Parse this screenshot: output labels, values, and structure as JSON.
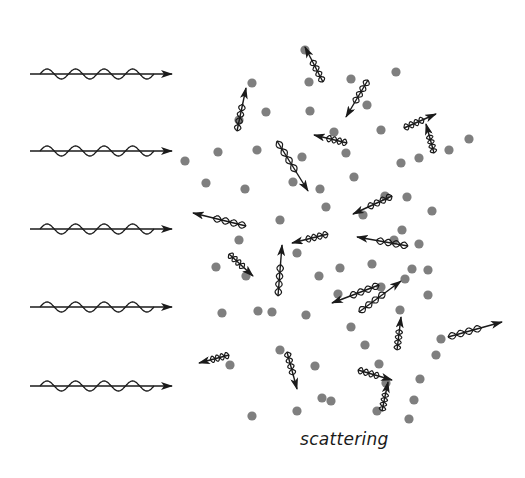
{
  "diagram": {
    "caption": "scattering",
    "colors": {
      "particle": "#7f7f7f",
      "wave": "#1a1a1a",
      "background": "#ffffff"
    },
    "incoming_waves": {
      "x_start": 30,
      "x_end": 172,
      "amplitude": 5,
      "cycles": 4,
      "rows_y": [
        74,
        151,
        229,
        307,
        386
      ]
    },
    "particles": [
      [
        305,
        50
      ],
      [
        252,
        83
      ],
      [
        309,
        82
      ],
      [
        351,
        79
      ],
      [
        396,
        72
      ],
      [
        367,
        105
      ],
      [
        266,
        112
      ],
      [
        310,
        111
      ],
      [
        239,
        120
      ],
      [
        334,
        132
      ],
      [
        381,
        130
      ],
      [
        185,
        161
      ],
      [
        218,
        152
      ],
      [
        257,
        150
      ],
      [
        302,
        157
      ],
      [
        346,
        153
      ],
      [
        401,
        163
      ],
      [
        419,
        158
      ],
      [
        449,
        150
      ],
      [
        469,
        139
      ],
      [
        206,
        183
      ],
      [
        245,
        189
      ],
      [
        293,
        182
      ],
      [
        320,
        189
      ],
      [
        354,
        177
      ],
      [
        385,
        196
      ],
      [
        407,
        197
      ],
      [
        432,
        211
      ],
      [
        239,
        240
      ],
      [
        280,
        220
      ],
      [
        326,
        207
      ],
      [
        363,
        215
      ],
      [
        394,
        240
      ],
      [
        402,
        230
      ],
      [
        419,
        244
      ],
      [
        216,
        267
      ],
      [
        246,
        276
      ],
      [
        297,
        253
      ],
      [
        319,
        276
      ],
      [
        340,
        268
      ],
      [
        372,
        264
      ],
      [
        412,
        269
      ],
      [
        428,
        270
      ],
      [
        222,
        313
      ],
      [
        258,
        311
      ],
      [
        306,
        315
      ],
      [
        338,
        294
      ],
      [
        381,
        287
      ],
      [
        405,
        279
      ],
      [
        230,
        365
      ],
      [
        272,
        312
      ],
      [
        280,
        350
      ],
      [
        315,
        366
      ],
      [
        351,
        327
      ],
      [
        400,
        310
      ],
      [
        428,
        295
      ],
      [
        441,
        339
      ],
      [
        322,
        398
      ],
      [
        386,
        383
      ],
      [
        365,
        345
      ],
      [
        379,
        364
      ],
      [
        420,
        379
      ],
      [
        436,
        355
      ],
      [
        414,
        400
      ],
      [
        252,
        416
      ],
      [
        297,
        411
      ],
      [
        331,
        401
      ],
      [
        377,
        411
      ],
      [
        409,
        419
      ]
    ],
    "scattered_photons": [
      {
        "x1": 323,
        "y1": 82,
        "x2": 305,
        "y2": 47
      },
      {
        "x1": 237,
        "y1": 131,
        "x2": 246,
        "y2": 88
      },
      {
        "x1": 368,
        "y1": 80,
        "x2": 346,
        "y2": 117
      },
      {
        "x1": 404,
        "y1": 128,
        "x2": 436,
        "y2": 114
      },
      {
        "x1": 434,
        "y1": 153,
        "x2": 426,
        "y2": 124
      },
      {
        "x1": 347,
        "y1": 143,
        "x2": 314,
        "y2": 135
      },
      {
        "x1": 277,
        "y1": 141,
        "x2": 308,
        "y2": 191
      },
      {
        "x1": 246,
        "y1": 226,
        "x2": 193,
        "y2": 213
      },
      {
        "x1": 392,
        "y1": 196,
        "x2": 353,
        "y2": 214
      },
      {
        "x1": 229,
        "y1": 254,
        "x2": 253,
        "y2": 276
      },
      {
        "x1": 278,
        "y1": 296,
        "x2": 282,
        "y2": 245
      },
      {
        "x1": 328,
        "y1": 234,
        "x2": 292,
        "y2": 243
      },
      {
        "x1": 408,
        "y1": 246,
        "x2": 357,
        "y2": 237
      },
      {
        "x1": 379,
        "y1": 285,
        "x2": 332,
        "y2": 303
      },
      {
        "x1": 359,
        "y1": 312,
        "x2": 401,
        "y2": 281
      },
      {
        "x1": 397,
        "y1": 350,
        "x2": 401,
        "y2": 317
      },
      {
        "x1": 448,
        "y1": 337,
        "x2": 502,
        "y2": 322
      },
      {
        "x1": 229,
        "y1": 355,
        "x2": 199,
        "y2": 363
      },
      {
        "x1": 287,
        "y1": 352,
        "x2": 297,
        "y2": 389
      },
      {
        "x1": 358,
        "y1": 370,
        "x2": 392,
        "y2": 380
      },
      {
        "x1": 382,
        "y1": 411,
        "x2": 388,
        "y2": 382
      }
    ]
  }
}
